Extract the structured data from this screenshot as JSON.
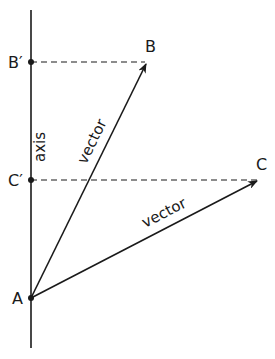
{
  "diagram": {
    "axis_label": "axis",
    "points": {
      "A": "A",
      "B": "B",
      "B_prime": "B′",
      "C": "C",
      "C_prime": "C′"
    },
    "vectors": [
      {
        "label": "vector",
        "from": "A",
        "to": "B"
      },
      {
        "label": "vector",
        "from": "A",
        "to": "C"
      }
    ],
    "projections": [
      {
        "from": "B",
        "to": "B′",
        "style": "dashed"
      },
      {
        "from": "C",
        "to": "C′",
        "style": "dashed"
      }
    ],
    "colors": {
      "ink": "#1a1a1a",
      "background": "#ffffff"
    }
  }
}
